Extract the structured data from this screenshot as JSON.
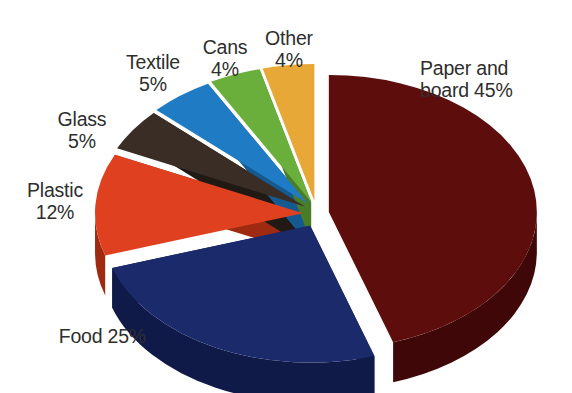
{
  "chart_data": {
    "type": "pie",
    "title": "",
    "subtitle": "",
    "xlabel": "",
    "ylabel": "",
    "legend_position": "none",
    "grid": false,
    "three_d": true,
    "exploded": true,
    "units": "percent",
    "categories": [
      "Paper and board",
      "Food",
      "Plastic",
      "Glass",
      "Textile",
      "Cans",
      "Other"
    ],
    "values": [
      45,
      25,
      12,
      5,
      5,
      4,
      4
    ],
    "colors": [
      "#5E0D0D",
      "#1B2A6B",
      "#DF4020",
      "#3A2D25",
      "#1E7BC4",
      "#6AAE3C",
      "#E8A838"
    ],
    "slices": [
      {
        "name": "paper-and-board",
        "label": "Paper and\nboard 45%",
        "category": "Paper and board",
        "value": 45,
        "color": "#5E0D0D",
        "side_color": "#3F0707",
        "start_angle": 0,
        "end_angle": 162
      },
      {
        "name": "food",
        "label": "Food 25%",
        "category": "Food",
        "value": 25,
        "color": "#1B2A6B",
        "side_color": "#101A48",
        "start_angle": 162,
        "end_angle": 252
      },
      {
        "name": "plastic",
        "label": "Plastic\n12%",
        "category": "Plastic",
        "value": 12,
        "color": "#DF4020",
        "side_color": "#9E2A12",
        "start_angle": 252,
        "end_angle": 295.2
      },
      {
        "name": "glass",
        "label": "Glass\n5%",
        "category": "Glass",
        "value": 5,
        "color": "#3A2D25",
        "side_color": "#211913",
        "start_angle": 295.2,
        "end_angle": 313.2
      },
      {
        "name": "textile",
        "label": "Textile\n5%",
        "category": "Textile",
        "value": 5,
        "color": "#1E7BC4",
        "side_color": "#145A91",
        "start_angle": 313.2,
        "end_angle": 331.2
      },
      {
        "name": "cans",
        "label": "Cans\n4%",
        "category": "Cans",
        "value": 4,
        "color": "#6AAE3C",
        "side_color": "#4A7D28",
        "start_angle": 331.2,
        "end_angle": 345.6
      },
      {
        "name": "other",
        "label": "Other\n4%",
        "category": "Other",
        "value": 4,
        "color": "#E8A838",
        "side_color": "#B07C1F",
        "start_angle": 345.6,
        "end_angle": 360
      }
    ]
  },
  "labels": {
    "paper": "Paper and\nboard 45%",
    "food": "Food 25%",
    "plastic": "Plastic\n12%",
    "glass": "Glass\n5%",
    "textile": "Textile\n5%",
    "cans": "Cans\n4%",
    "other": "Other\n4%"
  },
  "background_color": "#FFFFFF",
  "label_color": "#2E2E2E"
}
